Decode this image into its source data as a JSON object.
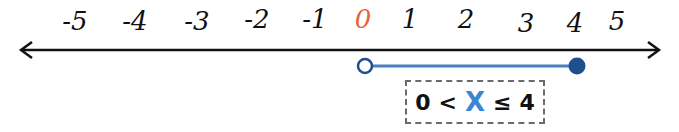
{
  "number_line": {
    "ticks": [
      {
        "label": "-5",
        "x": 75
      },
      {
        "label": "-4",
        "x": 135
      },
      {
        "label": "-3",
        "x": 197
      },
      {
        "label": "-2",
        "x": 257
      },
      {
        "label": "-1",
        "x": 315
      },
      {
        "label": "0",
        "x": 363
      },
      {
        "label": "1",
        "x": 410
      },
      {
        "label": "2",
        "x": 466
      },
      {
        "label": "3",
        "x": 526
      },
      {
        "label": "4",
        "x": 575
      },
      {
        "label": "5",
        "x": 617
      }
    ],
    "colors": {
      "axis": "#111111",
      "zero_label": "#e8633a",
      "segment": "#4a7fc1",
      "open_circle_stroke": "#1f4e8c",
      "closed_circle_fill": "#1f4e8c",
      "variable": "#3a86d4"
    }
  },
  "interval": {
    "start": 0,
    "end": 4,
    "start_type": "open",
    "end_type": "closed"
  },
  "inequality": {
    "left": "0",
    "op1": "<",
    "variable": "X",
    "op2": "≤",
    "right": "4"
  }
}
